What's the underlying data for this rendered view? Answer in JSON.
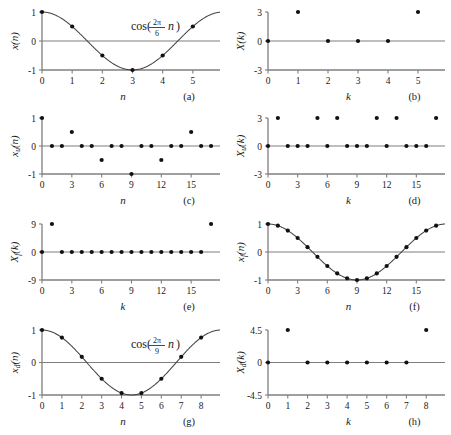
{
  "figure": {
    "background": "#ffffff",
    "ink": "#1a1a1a",
    "axis_color": "#7f7f7f",
    "marker_color": "#111111",
    "curve_color": "#444444",
    "width": 451,
    "height": 435
  },
  "panels": [
    {
      "id": "a",
      "caption": "(a)",
      "ylabel": "x(n)",
      "xlabel": "n",
      "annotation": {
        "prefix": "cos(",
        "num": "2π",
        "den": "6",
        "var": "n",
        "suffix": ")"
      },
      "chart_data": {
        "type": "scatter",
        "title": "cos(2πn/6)",
        "xlabel": "n",
        "ylabel": "x(n)",
        "xlim": [
          0,
          5.9
        ],
        "ylim": [
          -1,
          1
        ],
        "xticks": [
          0,
          1,
          2,
          3,
          4,
          5
        ],
        "yticks": [
          1,
          0,
          -1
        ],
        "ytick_labels": [
          "1",
          "0",
          "-1"
        ],
        "grid": false,
        "has_curve": true,
        "curve_period": 6,
        "x": [
          0,
          1,
          2,
          3,
          4,
          5
        ],
        "values": [
          1,
          0.5,
          -0.5,
          -1,
          -0.5,
          0.5
        ]
      }
    },
    {
      "id": "b",
      "caption": "(b)",
      "ylabel": "X(k)",
      "xlabel": "k",
      "annotation": null,
      "chart_data": {
        "type": "scatter",
        "title": "",
        "xlabel": "k",
        "ylabel": "X(k)",
        "xlim": [
          0,
          5.9
        ],
        "ylim": [
          -3,
          3
        ],
        "xticks": [
          0,
          1,
          2,
          3,
          4,
          5
        ],
        "yticks": [
          3,
          0,
          -3
        ],
        "ytick_labels": [
          "3",
          "0",
          "-3"
        ],
        "grid": false,
        "has_curve": false,
        "x": [
          0,
          1,
          2,
          3,
          4,
          5
        ],
        "values": [
          0,
          3,
          0,
          0,
          0,
          3
        ]
      }
    },
    {
      "id": "c",
      "caption": "(c)",
      "ylabel": "xᵤ(n)",
      "ylabel_base": "x",
      "ylabel_sub": "u",
      "ylabel_arg": "(n)",
      "xlabel": "n",
      "annotation": null,
      "chart_data": {
        "type": "scatter",
        "title": "",
        "xlabel": "n",
        "ylabel": "x_u(n)",
        "xlim": [
          0,
          17.9
        ],
        "ylim": [
          -1,
          1
        ],
        "xticks": [
          0,
          3,
          6,
          9,
          12,
          15
        ],
        "yticks": [
          1,
          0,
          -1
        ],
        "ytick_labels": [
          "1",
          "0",
          "-1"
        ],
        "grid": false,
        "has_curve": false,
        "x": [
          0,
          1,
          2,
          3,
          4,
          5,
          6,
          7,
          8,
          9,
          10,
          11,
          12,
          13,
          14,
          15,
          16,
          17
        ],
        "values": [
          1,
          0,
          0,
          0.5,
          0,
          0,
          -0.5,
          0,
          0,
          -1,
          0,
          0,
          -0.5,
          0,
          0,
          0.5,
          0,
          0
        ]
      }
    },
    {
      "id": "d",
      "caption": "(d)",
      "ylabel_base": "X",
      "ylabel_sub": "u",
      "ylabel_arg": "(k)",
      "xlabel": "k",
      "annotation": null,
      "chart_data": {
        "type": "scatter",
        "title": "",
        "xlabel": "k",
        "ylabel": "X_u(k)",
        "xlim": [
          0,
          17.9
        ],
        "ylim": [
          -3,
          3
        ],
        "xticks": [
          0,
          3,
          6,
          9,
          12,
          15
        ],
        "yticks": [
          3,
          0,
          -3
        ],
        "ytick_labels": [
          "3",
          "0",
          "-3"
        ],
        "grid": false,
        "has_curve": false,
        "x": [
          0,
          1,
          2,
          3,
          4,
          5,
          6,
          7,
          8,
          9,
          10,
          11,
          12,
          13,
          14,
          15,
          16,
          17
        ],
        "values": [
          0,
          3,
          0,
          0,
          0,
          3,
          0,
          3,
          0,
          0,
          0,
          3,
          0,
          3,
          0,
          0,
          0,
          3
        ]
      }
    },
    {
      "id": "e",
      "caption": "(e)",
      "ylabel_base": "X",
      "ylabel_sub": "f",
      "ylabel_arg": "(k)",
      "xlabel": "k",
      "annotation": null,
      "chart_data": {
        "type": "scatter",
        "title": "",
        "xlabel": "k",
        "ylabel": "X_f(k)",
        "xlim": [
          0,
          17.9
        ],
        "ylim": [
          -9,
          9
        ],
        "xticks": [
          0,
          3,
          6,
          9,
          12,
          15
        ],
        "yticks": [
          9,
          0,
          -9
        ],
        "ytick_labels": [
          "9",
          "0",
          "-9"
        ],
        "grid": false,
        "has_curve": false,
        "x": [
          0,
          1,
          2,
          3,
          4,
          5,
          6,
          7,
          8,
          9,
          10,
          11,
          12,
          13,
          14,
          15,
          16,
          17
        ],
        "values": [
          0,
          9,
          0,
          0,
          0,
          0,
          0,
          0,
          0,
          0,
          0,
          0,
          0,
          0,
          0,
          0,
          0,
          9
        ]
      }
    },
    {
      "id": "f",
      "caption": "(f)",
      "ylabel_base": "x",
      "ylabel_sub": "f",
      "ylabel_arg": "(n)",
      "xlabel": "n",
      "annotation": null,
      "chart_data": {
        "type": "scatter",
        "title": "",
        "xlabel": "n",
        "ylabel": "x_f(n)",
        "xlim": [
          0,
          17.9
        ],
        "ylim": [
          -1,
          1
        ],
        "xticks": [
          0,
          3,
          6,
          9,
          12,
          15
        ],
        "yticks": [
          1,
          0,
          -1
        ],
        "ytick_labels": [
          "1",
          "0",
          "-1"
        ],
        "grid": false,
        "has_curve": true,
        "curve_period": 18,
        "x": [
          0,
          1,
          2,
          3,
          4,
          5,
          6,
          7,
          8,
          9,
          10,
          11,
          12,
          13,
          14,
          15,
          16,
          17
        ],
        "values": [
          1,
          0.9397,
          0.766,
          0.5,
          0.1736,
          -0.1736,
          -0.5,
          -0.766,
          -0.9397,
          -1,
          -0.9397,
          -0.766,
          -0.5,
          -0.1736,
          0.1736,
          0.5,
          0.766,
          0.9397
        ]
      }
    },
    {
      "id": "g",
      "caption": "(g)",
      "ylabel_base": "x",
      "ylabel_sub": "d",
      "ylabel_arg": "(n)",
      "xlabel": "n",
      "annotation": {
        "prefix": "cos(",
        "num": "2π",
        "den": "9",
        "var": "n",
        "suffix": ")"
      },
      "chart_data": {
        "type": "scatter",
        "title": "cos(2πn/9)",
        "xlabel": "n",
        "ylabel": "x_d(n)",
        "xlim": [
          0,
          8.95
        ],
        "ylim": [
          -1,
          1
        ],
        "xticks": [
          0,
          1,
          2,
          3,
          4,
          5,
          6,
          7,
          8
        ],
        "yticks": [
          1,
          0,
          -1
        ],
        "ytick_labels": [
          "1",
          "0",
          "-1"
        ],
        "grid": false,
        "has_curve": true,
        "curve_period": 9,
        "x": [
          0,
          1,
          2,
          3,
          4,
          5,
          6,
          7,
          8
        ],
        "values": [
          1,
          0.766,
          0.1736,
          -0.5,
          -0.9397,
          -0.9397,
          -0.5,
          0.1736,
          0.766
        ]
      }
    },
    {
      "id": "h",
      "caption": "(h)",
      "ylabel_base": "X",
      "ylabel_sub": "d",
      "ylabel_arg": "(k)",
      "xlabel": "k",
      "annotation": null,
      "chart_data": {
        "type": "scatter",
        "title": "",
        "xlabel": "k",
        "ylabel": "X_d(k)",
        "xlim": [
          0,
          8.95
        ],
        "ylim": [
          -4.5,
          4.5
        ],
        "xticks": [
          0,
          1,
          2,
          3,
          4,
          5,
          6,
          7,
          8
        ],
        "yticks": [
          4.5,
          0,
          -4.5
        ],
        "ytick_labels": [
          "4.5",
          "0",
          "-4.5"
        ],
        "grid": false,
        "has_curve": false,
        "x": [
          0,
          1,
          2,
          3,
          4,
          5,
          6,
          7,
          8
        ],
        "values": [
          0,
          4.5,
          0,
          0,
          0,
          0,
          0,
          0,
          4.5
        ]
      }
    }
  ]
}
